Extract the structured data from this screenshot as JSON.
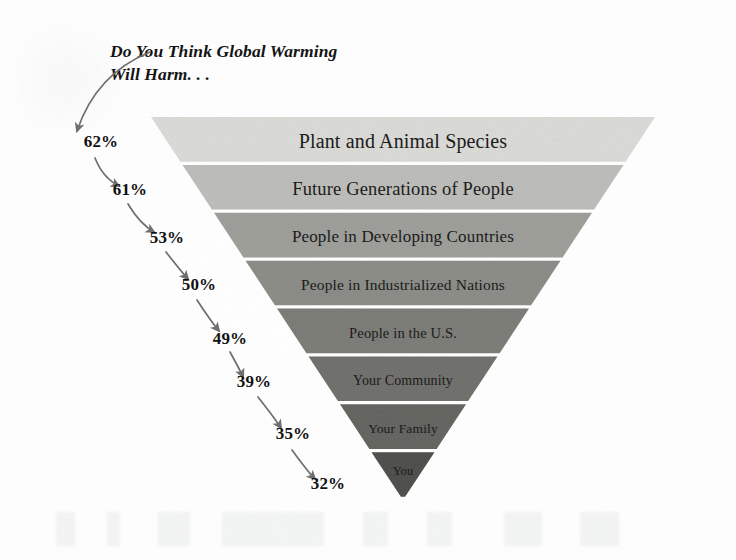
{
  "title": "Do You Think Global Warming\nWill Harm. . .",
  "colors": {
    "text": "#1b1b1b",
    "percent_text": "#111111",
    "arrow": "#6e6e6e",
    "background": "#ffffff"
  },
  "chart_data": {
    "type": "bar",
    "subtype": "inverted-funnel",
    "title": "Do You Think Global Warming Will Harm. . .",
    "xlabel": "",
    "ylabel": "",
    "value_suffix": "%",
    "orientation": "vertical-descending",
    "legend": "none",
    "grid": false,
    "ylim": [
      0,
      100
    ],
    "categories": [
      "Plant and Animal Species",
      "Future Generations of People",
      "People in Developing Countries",
      "People in Industrialized Nations",
      "People in the U.S.",
      "Your Community",
      "Your Family",
      "You"
    ],
    "values": [
      62,
      61,
      53,
      50,
      49,
      39,
      35,
      32
    ],
    "value_labels": [
      "62%",
      "61%",
      "53%",
      "50%",
      "49%",
      "39%",
      "35%",
      "32%"
    ],
    "band_colors": [
      "#ededeb",
      "#dcdcda",
      "#c9c9c6",
      "#bdbdba",
      "#b2b2af",
      "#a9a9a6",
      "#a0a09d",
      "#8e8e8b"
    ]
  },
  "bands": [
    {
      "label": "Plant and Animal Species",
      "percent": "62%",
      "font_size": "20px"
    },
    {
      "label": "Future Generations of People",
      "percent": "61%",
      "font_size": "18.5px"
    },
    {
      "label": "People in Developing Countries",
      "percent": "53%",
      "font_size": "17px"
    },
    {
      "label": "People in Industrialized Nations",
      "percent": "50%",
      "font_size": "15.5px"
    },
    {
      "label": "People in the U.S.",
      "percent": "49%",
      "font_size": "14.5px"
    },
    {
      "label": "Your Community",
      "percent": "39%",
      "font_size": "14px"
    },
    {
      "label": "Your Family",
      "percent": "35%",
      "font_size": "13.5px"
    },
    {
      "label": "You",
      "percent": "32%",
      "font_size": "12.5px"
    }
  ]
}
